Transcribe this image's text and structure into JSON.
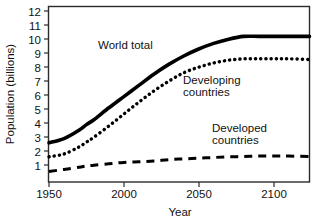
{
  "chart_data": {
    "type": "line",
    "title": "",
    "xlabel": "Year",
    "ylabel": "Population (billions)",
    "xlim": [
      1950,
      2124
    ],
    "ylim": [
      0,
      12.6
    ],
    "grid": false,
    "legend": "inline-annotations",
    "xticks": [
      1950,
      2000,
      2050,
      2100
    ],
    "xticklabels": [
      "1950",
      "2000",
      "2050",
      "2100"
    ],
    "yticks": [
      1,
      2,
      3,
      4,
      5,
      6,
      7,
      8,
      9,
      10,
      11,
      12
    ],
    "yticklabels": [
      "1",
      "2",
      "3",
      "4",
      "5",
      "6",
      "7",
      "8",
      "9",
      "10",
      "11",
      "12"
    ],
    "x": [
      1950,
      1960,
      1970,
      1975,
      1980,
      1990,
      2000,
      2010,
      2020,
      2030,
      2040,
      2050,
      2060,
      2070,
      2080,
      2090,
      2100,
      2110,
      2124
    ],
    "series": [
      {
        "name": "World total",
        "style": "solid",
        "color": "#000000",
        "values": [
          2.8,
          3.1,
          3.7,
          4.1,
          4.45,
          5.3,
          6.1,
          6.9,
          7.7,
          8.4,
          9.0,
          9.5,
          9.9,
          10.2,
          10.4,
          10.4,
          10.4,
          10.4,
          10.4
        ]
      },
      {
        "name": "Developing countries",
        "style": "dotted",
        "color": "#000000",
        "values": [
          1.8,
          2.0,
          2.5,
          2.85,
          3.2,
          4.0,
          4.85,
          5.7,
          6.5,
          7.2,
          7.8,
          8.2,
          8.5,
          8.7,
          8.8,
          8.8,
          8.8,
          8.8,
          8.75
        ]
      },
      {
        "name": "Developed countries",
        "style": "dashed",
        "color": "#000000",
        "values": [
          0.75,
          0.9,
          1.05,
          1.15,
          1.2,
          1.3,
          1.4,
          1.45,
          1.5,
          1.6,
          1.65,
          1.7,
          1.75,
          1.8,
          1.82,
          1.85,
          1.85,
          1.85,
          1.82
        ]
      }
    ],
    "annotations": [
      {
        "text": "World total",
        "x": 1990,
        "y": 10.6
      },
      {
        "text_line1": "Developing",
        "text_line2": "countries",
        "x": 2042,
        "y": 7.3
      },
      {
        "text_line1": "Developed",
        "text_line2": "countries",
        "x": 2062,
        "y": 3.9
      }
    ]
  },
  "labels": {
    "y_axis_title": "Population (billions)",
    "x_axis_title": "Year",
    "world_total": "World total",
    "developing_line1": "Developing",
    "developing_line2": "countries",
    "developed_line1": "Developed",
    "developed_line2": "countries",
    "ytick_12": "12",
    "ytick_11": "11",
    "ytick_10": "10",
    "ytick_9": "9",
    "ytick_8": "8",
    "ytick_7": "7",
    "ytick_6": "6",
    "ytick_5": "5",
    "ytick_4": "4",
    "ytick_3": "3",
    "ytick_2": "2",
    "ytick_1": "1",
    "xtick_1950": "1950",
    "xtick_2000": "2000",
    "xtick_2050": "2050",
    "xtick_2100": "2100"
  }
}
